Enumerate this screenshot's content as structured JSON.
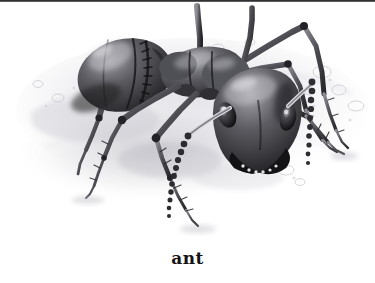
{
  "figure": {
    "caption": "ant",
    "subject": "ant",
    "medium": "grayscale pencil / stipple illustration",
    "colors": {
      "background": "#ffffff",
      "top_rule": "#2a2a2c",
      "caption_text": "#131316",
      "body_dark": "#2f2f33",
      "body_mid": "#6a6a70",
      "body_light": "#b9b9be",
      "highlight": "#e6e6e9",
      "ground_shadow": "#c9c9cf",
      "ground_light": "#ededf0"
    },
    "parts": [
      {
        "name": "gaster",
        "label": "abdomen (gaster)"
      },
      {
        "name": "petiole",
        "label": "petiole"
      },
      {
        "name": "mesosoma",
        "label": "thorax (mesosoma)"
      },
      {
        "name": "head",
        "label": "head"
      },
      {
        "name": "compound-eye-left",
        "label": "left compound eye"
      },
      {
        "name": "compound-eye-right",
        "label": "right compound eye"
      },
      {
        "name": "mandible-left",
        "label": "left mandible"
      },
      {
        "name": "mandible-right",
        "label": "right mandible"
      },
      {
        "name": "antenna-left",
        "label": "left antenna"
      },
      {
        "name": "antenna-right",
        "label": "right antenna"
      },
      {
        "name": "leg-fore-left",
        "label": "left foreleg"
      },
      {
        "name": "leg-fore-right",
        "label": "right foreleg"
      },
      {
        "name": "leg-mid-left",
        "label": "left middle leg"
      },
      {
        "name": "leg-mid-right",
        "label": "right middle leg"
      },
      {
        "name": "leg-hind-left",
        "label": "left hind leg"
      },
      {
        "name": "leg-hind-right",
        "label": "right hind leg"
      }
    ],
    "ground": {
      "name": "sandy-ground",
      "label": "sandy ground with pebbles"
    }
  }
}
